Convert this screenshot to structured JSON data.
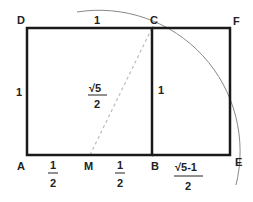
{
  "diagram": {
    "points": {
      "A": "A",
      "B": "B",
      "C": "C",
      "D": "D",
      "E": "E",
      "F": "F",
      "M": "M"
    },
    "labels": {
      "top_side": "1",
      "left_side": "1",
      "inner_side": "1",
      "diagonal_num": "√5",
      "diagonal_den": "2",
      "am_num": "1",
      "am_den": "2",
      "mb_num": "1",
      "mb_den": "2",
      "be_num": "√5-1",
      "be_den": "2"
    },
    "colors": {
      "lines": "#1a1a1a",
      "arc": "#888888",
      "dashed": "#bbbbbb",
      "text": "#222222"
    }
  }
}
